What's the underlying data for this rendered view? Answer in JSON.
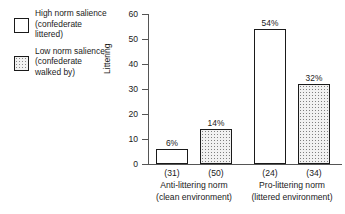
{
  "legend": {
    "items": [
      {
        "swatch": "open-square-swatch",
        "lines": [
          "High norm salience",
          "(confederate",
          "littered)"
        ]
      },
      {
        "swatch": "stippled-square-swatch",
        "lines": [
          "Low norm salience",
          "(confederate",
          "walked by)"
        ]
      }
    ]
  },
  "chart_data": {
    "type": "bar",
    "title": "",
    "xlabel": "",
    "ylabel": "Littering",
    "ylim": [
      0,
      60
    ],
    "yticks": [
      0,
      10,
      20,
      30,
      40,
      50,
      60
    ],
    "ytick_labels": [
      "0",
      "10",
      "20",
      "30",
      "40",
      "50",
      "60"
    ],
    "grid": false,
    "legend_position": "left-outside",
    "categories": [
      "Anti-littering norm\n(clean environment)",
      "Pro-littering norm\n(littered environment)"
    ],
    "group_labels": [
      {
        "line1": "Anti-littering norm",
        "line2": "(clean environment)"
      },
      {
        "line1": "Pro-littering norm",
        "line2": "(littered environment)"
      }
    ],
    "series": [
      {
        "name": "High norm salience (confederate littered)",
        "style": "open",
        "values": [
          6,
          54
        ],
        "value_labels": [
          "6%",
          "54%"
        ],
        "sample_sizes": [
          31,
          24
        ],
        "sample_labels": [
          "(31)",
          "(24)"
        ]
      },
      {
        "name": "Low norm salience (confederate walked by)",
        "style": "stipple",
        "values": [
          14,
          32
        ],
        "value_labels": [
          "14%",
          "32%"
        ],
        "sample_sizes": [
          50,
          34
        ],
        "sample_labels": [
          "(50)",
          "(34)"
        ]
      }
    ],
    "bars": [
      {
        "value": 6,
        "value_label": "6%",
        "sample_label": "(31)",
        "style": "open",
        "group": 0,
        "series": 0
      },
      {
        "value": 14,
        "value_label": "14%",
        "sample_label": "(50)",
        "style": "stipple",
        "group": 0,
        "series": 1
      },
      {
        "value": 54,
        "value_label": "54%",
        "sample_label": "(24)",
        "style": "open",
        "group": 1,
        "series": 0
      },
      {
        "value": 32,
        "value_label": "32%",
        "sample_label": "(34)",
        "style": "stipple",
        "group": 1,
        "series": 1
      }
    ],
    "colors": {
      "axis": "#555555",
      "bar_outline": "#1a1a1a",
      "bar_open_fill": "#ffffff",
      "bar_stipple_fill": "#f1f1f1",
      "text": "#1a1a1a",
      "background": "#ffffff"
    }
  }
}
